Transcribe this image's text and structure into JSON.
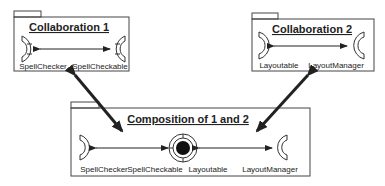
{
  "packages": {
    "collab1": {
      "title": "Collaboration 1",
      "left_role": "SpellChecker",
      "right_role": "SpellCheckable"
    },
    "collab2": {
      "title": "Collaboration 2",
      "left_role": "Layoutable",
      "right_role": "LayoutManager"
    },
    "composition": {
      "title": "Composition of 1 and 2",
      "roles": [
        "SpellChecker",
        "SpellCheckable",
        "Layoutable",
        "LayoutManager"
      ]
    }
  },
  "colors": {
    "stroke": "#222222",
    "background": "#ffffff"
  }
}
